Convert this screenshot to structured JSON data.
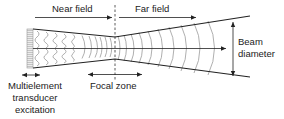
{
  "diagram": {
    "labels": {
      "near_field": "Near field",
      "far_field": "Far field",
      "beam_diameter_line1": "Beam",
      "beam_diameter_line2": "diameter",
      "focal_zone": "Focal zone",
      "transducer_line1": "Multielement",
      "transducer_line2": "transducer",
      "transducer_line3": "excitation"
    },
    "colors": {
      "line": "#222222",
      "wave": "#9a9a9a",
      "transducer_fill": "#bdbdbd",
      "transducer_stripe": "#e8e8e8"
    }
  }
}
